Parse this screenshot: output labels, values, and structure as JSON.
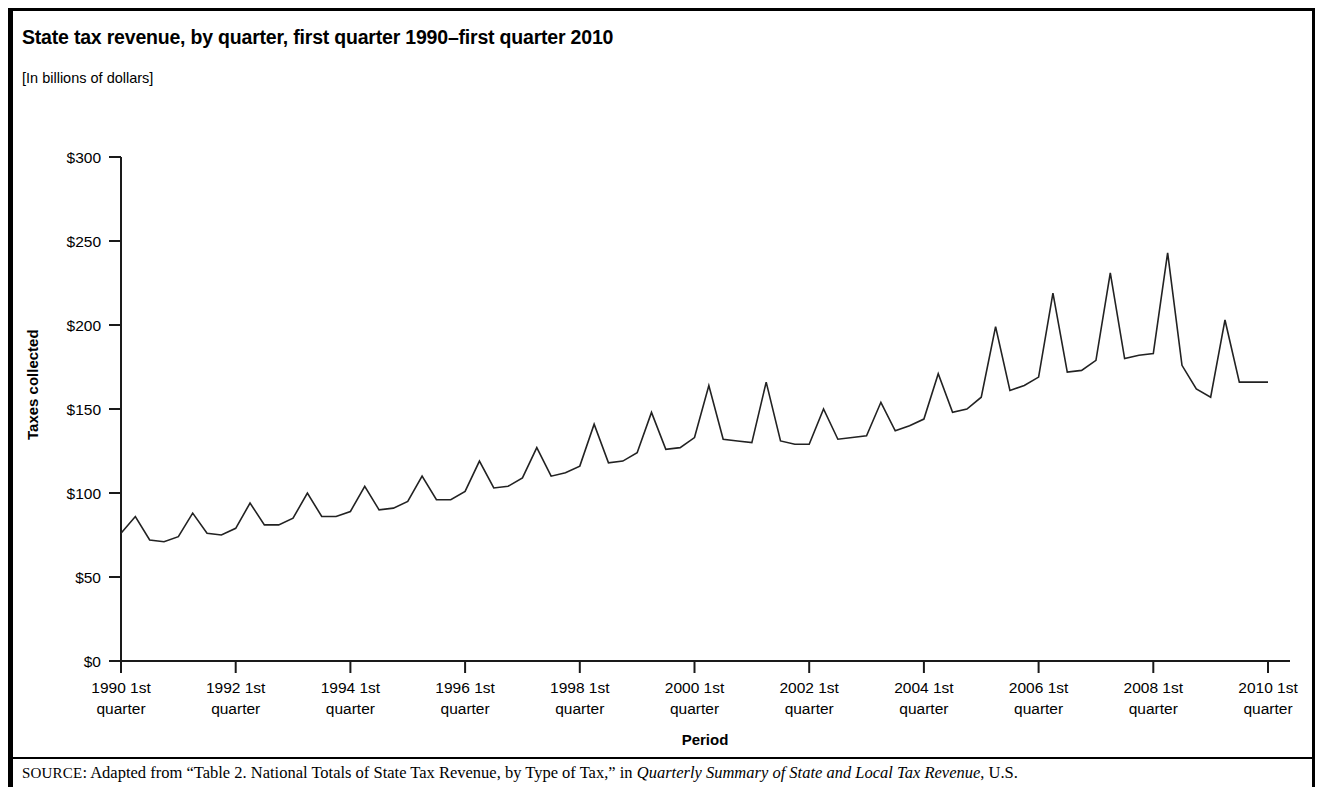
{
  "figure": {
    "title": "State tax revenue, by quarter, first quarter 1990–first quarter 2010",
    "units_note": "[In billions of dollars]",
    "source_prefix": "SOURCE",
    "source_part1": ": Adapted from “Table 2. National Totals of State Tax Revenue, by Type of Tax,” in ",
    "source_italic": "Quarterly Summary of State and Local Tax Revenue",
    "source_part2": ", U.S."
  },
  "chart_data": {
    "type": "line",
    "title": "State tax revenue, by quarter, first quarter 1990–first quarter 2010",
    "subtitle": "[In billions of dollars]",
    "xlabel": "Period",
    "ylabel": "Taxes collected",
    "ylim": [
      0,
      300
    ],
    "ytick_values": [
      0,
      50,
      100,
      150,
      200,
      250,
      300
    ],
    "ytick_labels": [
      "$0",
      "$50",
      "$100",
      "$150",
      "$200",
      "$250",
      "$300"
    ],
    "xtick_labels": [
      "1990 1st quarter",
      "1992 1st quarter",
      "1994 1st quarter",
      "1996 1st quarter",
      "1998 1st quarter",
      "2000 1st quarter",
      "2002 1st quarter",
      "2004 1st quarter",
      "2006 1st quarter",
      "2008 1st quarter",
      "2010 1st quarter"
    ],
    "xtick_lines": [
      [
        "1990 1st",
        "quarter"
      ],
      [
        "1992 1st",
        "quarter"
      ],
      [
        "1994 1st",
        "quarter"
      ],
      [
        "1996 1st",
        "quarter"
      ],
      [
        "1998 1st",
        "quarter"
      ],
      [
        "2000 1st",
        "quarter"
      ],
      [
        "2002 1st",
        "quarter"
      ],
      [
        "2004 1st",
        "quarter"
      ],
      [
        "2006 1st",
        "quarter"
      ],
      [
        "2008 1st",
        "quarter"
      ],
      [
        "2010 1st",
        "quarter"
      ]
    ],
    "xtick_indices": [
      0,
      8,
      16,
      24,
      32,
      40,
      48,
      56,
      64,
      72,
      80
    ],
    "grid": false,
    "legend": false,
    "line_color": "#222222",
    "x": [
      "1990 Q1",
      "1990 Q2",
      "1990 Q3",
      "1990 Q4",
      "1991 Q1",
      "1991 Q2",
      "1991 Q3",
      "1991 Q4",
      "1992 Q1",
      "1992 Q2",
      "1992 Q3",
      "1992 Q4",
      "1993 Q1",
      "1993 Q2",
      "1993 Q3",
      "1993 Q4",
      "1994 Q1",
      "1994 Q2",
      "1994 Q3",
      "1994 Q4",
      "1995 Q1",
      "1995 Q2",
      "1995 Q3",
      "1995 Q4",
      "1996 Q1",
      "1996 Q2",
      "1996 Q3",
      "1996 Q4",
      "1997 Q1",
      "1997 Q2",
      "1997 Q3",
      "1997 Q4",
      "1998 Q1",
      "1998 Q2",
      "1998 Q3",
      "1998 Q4",
      "1999 Q1",
      "1999 Q2",
      "1999 Q3",
      "1999 Q4",
      "2000 Q1",
      "2000 Q2",
      "2000 Q3",
      "2000 Q4",
      "2001 Q1",
      "2001 Q2",
      "2001 Q3",
      "2001 Q4",
      "2002 Q1",
      "2002 Q2",
      "2002 Q3",
      "2002 Q4",
      "2003 Q1",
      "2003 Q2",
      "2003 Q3",
      "2003 Q4",
      "2004 Q1",
      "2004 Q2",
      "2004 Q3",
      "2004 Q4",
      "2005 Q1",
      "2005 Q2",
      "2005 Q3",
      "2005 Q4",
      "2006 Q1",
      "2006 Q2",
      "2006 Q3",
      "2006 Q4",
      "2007 Q1",
      "2007 Q2",
      "2007 Q3",
      "2007 Q4",
      "2008 Q1",
      "2008 Q2",
      "2008 Q3",
      "2008 Q4",
      "2009 Q1",
      "2009 Q2",
      "2009 Q3",
      "2009 Q4",
      "2010 Q1"
    ],
    "values": [
      76,
      86,
      72,
      71,
      74,
      88,
      76,
      75,
      79,
      94,
      81,
      81,
      85,
      100,
      86,
      86,
      89,
      104,
      90,
      91,
      95,
      110,
      96,
      96,
      101,
      119,
      103,
      104,
      109,
      127,
      110,
      112,
      116,
      141,
      118,
      119,
      124,
      148,
      126,
      127,
      133,
      164,
      132,
      131,
      130,
      166,
      131,
      129,
      129,
      150,
      132,
      133,
      134,
      154,
      137,
      140,
      144,
      171,
      148,
      150,
      157,
      199,
      161,
      164,
      169,
      219,
      172,
      173,
      179,
      231,
      180,
      182,
      183,
      243,
      176,
      162,
      157,
      203,
      166,
      166,
      166
    ],
    "annotations": []
  }
}
